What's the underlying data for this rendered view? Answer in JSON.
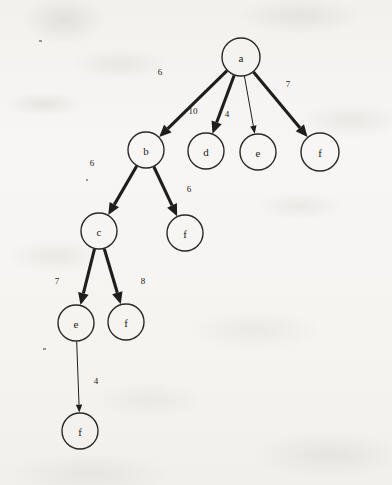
{
  "figure": {
    "background_color": "#f5f4f1",
    "ink_color": "#201e1c"
  },
  "graph_data": {
    "type": "diagram",
    "directed": true,
    "nodes": [
      {
        "id": "n_a",
        "label": "a",
        "x": 241,
        "y": 57,
        "r": 19
      },
      {
        "id": "n_b",
        "label": "b",
        "x": 146,
        "y": 150,
        "r": 18
      },
      {
        "id": "n_d",
        "label": "d",
        "x": 206,
        "y": 151,
        "r": 18
      },
      {
        "id": "n_e1",
        "label": "e",
        "x": 258,
        "y": 152,
        "r": 18
      },
      {
        "id": "n_f1",
        "label": "f",
        "x": 320,
        "y": 152,
        "r": 19
      },
      {
        "id": "n_c",
        "label": "c",
        "x": 99,
        "y": 231,
        "r": 18
      },
      {
        "id": "n_f2",
        "label": "f",
        "x": 185,
        "y": 233,
        "r": 18
      },
      {
        "id": "n_e2",
        "label": "e",
        "x": 76,
        "y": 323,
        "r": 18
      },
      {
        "id": "n_f3",
        "label": "f",
        "x": 126,
        "y": 322,
        "r": 18
      },
      {
        "id": "n_f4",
        "label": "f",
        "x": 80,
        "y": 431,
        "r": 18
      }
    ],
    "edges": [
      {
        "from": "n_a",
        "to": "n_b",
        "weight": "6",
        "label_x": 160,
        "label_y": 72,
        "style": "thick"
      },
      {
        "from": "n_a",
        "to": "n_d",
        "weight": "10",
        "label_x": 193,
        "label_y": 111,
        "style": "thick"
      },
      {
        "from": "n_a",
        "to": "n_e1",
        "weight": "4",
        "label_x": 227,
        "label_y": 114,
        "style": "thin"
      },
      {
        "from": "n_a",
        "to": "n_f1",
        "weight": "7",
        "label_x": 288,
        "label_y": 84,
        "style": "thick"
      },
      {
        "from": "n_b",
        "to": "n_c",
        "weight": "6",
        "label_x": 92,
        "label_y": 163,
        "style": "thick"
      },
      {
        "from": "n_b",
        "to": "n_f2",
        "weight": "6",
        "label_x": 189,
        "label_y": 189,
        "style": "thick"
      },
      {
        "from": "n_c",
        "to": "n_e2",
        "weight": "7",
        "label_x": 57,
        "label_y": 281,
        "style": "thick"
      },
      {
        "from": "n_c",
        "to": "n_f3",
        "weight": "8",
        "label_x": 143,
        "label_y": 281,
        "style": "thick"
      },
      {
        "from": "n_e2",
        "to": "n_f4",
        "weight": "4",
        "label_x": 96,
        "label_y": 381,
        "style": "thin"
      }
    ],
    "specks": [
      {
        "x": 39,
        "y": 40,
        "w": 3,
        "h": 2
      },
      {
        "x": 86,
        "y": 179,
        "w": 2,
        "h": 2
      },
      {
        "x": 43,
        "y": 348,
        "w": 3,
        "h": 2
      }
    ]
  }
}
